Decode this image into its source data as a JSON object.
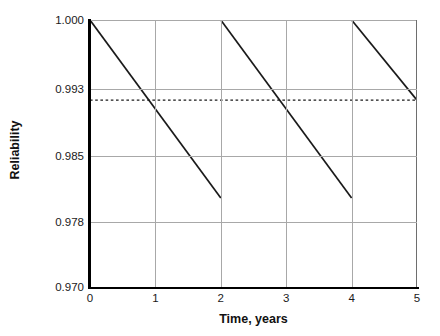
{
  "chart_data": {
    "type": "line",
    "title": "",
    "xlabel": "Time, years",
    "ylabel": "Reliability",
    "xlim": [
      0,
      5
    ],
    "ylim": [
      0.97,
      1.0
    ],
    "grid": true,
    "legend": "none",
    "xticks": [
      "0",
      "1",
      "2",
      "3",
      "4",
      "5"
    ],
    "xtick_values": [
      0,
      1,
      2,
      3,
      4,
      5
    ],
    "yticks": [
      "1.000",
      "0.993",
      "0.985",
      "0.978",
      "0.970"
    ],
    "ytick_values": [
      1.0,
      0.993,
      0.985,
      0.978,
      0.97
    ],
    "series": [
      {
        "name": "Reliability with periodic maintenance",
        "style": "solid",
        "color": "#1a1a1a",
        "segments": [
          {
            "x": [
              0,
              2
            ],
            "y": [
              1.0,
              0.98
            ]
          },
          {
            "x": [
              2,
              4
            ],
            "y": [
              1.0,
              0.98
            ]
          },
          {
            "x": [
              4,
              5
            ],
            "y": [
              1.0,
              0.991
            ]
          }
        ]
      },
      {
        "name": "Average reliability",
        "style": "dotted",
        "color": "#1a1a1a",
        "x": [
          0,
          5
        ],
        "y": [
          0.991,
          0.991
        ],
        "value": 0.991
      }
    ]
  },
  "axis": {
    "y_label": "Reliability",
    "x_label": "Time, years",
    "y_ticks": [
      "1.000",
      "0.993",
      "0.985",
      "0.978",
      "0.970"
    ],
    "x_ticks": [
      "0",
      "1",
      "2",
      "3",
      "4",
      "5"
    ]
  },
  "colors": {
    "data_line": "#1a1a1a",
    "gridline": "#a8a8a8",
    "spine": "#000000",
    "background": "#ffffff",
    "text": "#1a1a1a"
  }
}
